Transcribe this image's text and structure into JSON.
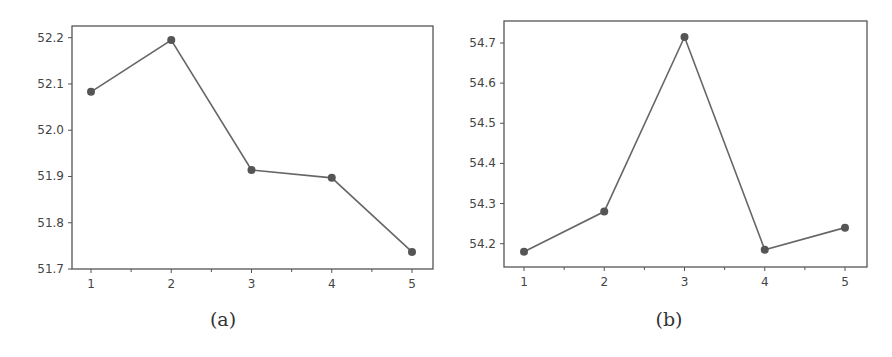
{
  "chart_data": [
    {
      "type": "line",
      "panel": "a",
      "caption": "(a)",
      "title": "",
      "xlabel": "",
      "ylabel": "",
      "x": [
        1,
        2,
        3,
        4,
        5
      ],
      "values": [
        52.083,
        52.195,
        51.914,
        51.897,
        51.737
      ],
      "xticks": [
        "1",
        "2",
        "3",
        "4",
        "5"
      ],
      "yticks": [
        "51.7",
        "51.8",
        "51.9",
        "52.0",
        "52.1",
        "52.2"
      ],
      "ylim": [
        51.7,
        52.2
      ],
      "grid": false,
      "legend": null,
      "color": "#666666"
    },
    {
      "type": "line",
      "panel": "b",
      "caption": "(b)",
      "title": "",
      "xlabel": "",
      "ylabel": "",
      "x": [
        1,
        2,
        3,
        4,
        5
      ],
      "values": [
        54.18,
        54.28,
        54.715,
        54.185,
        54.24
      ],
      "xticks": [
        "1",
        "2",
        "3",
        "4",
        "5"
      ],
      "yticks": [
        "54.2",
        "54.3",
        "54.4",
        "54.5",
        "54.6",
        "54.7"
      ],
      "ylim": [
        54.15,
        54.75
      ],
      "grid": false,
      "legend": null,
      "color": "#666666"
    }
  ],
  "captions": {
    "a": "(a)",
    "b": "(b)"
  }
}
